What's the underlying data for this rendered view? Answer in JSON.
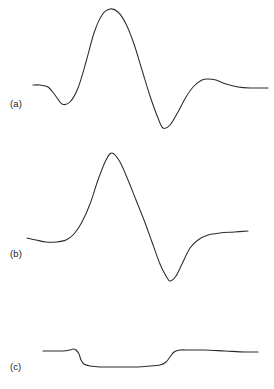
{
  "figure": {
    "background_color": "#ffffff",
    "trace_color": "#2b2b2b",
    "label_color": "#1b1b1b",
    "width": 274,
    "height": 389,
    "panel_labels": [
      {
        "id": "a",
        "text": "(a)"
      },
      {
        "id": "b",
        "text": "(b)"
      },
      {
        "id": "c",
        "text": "(c)"
      }
    ]
  },
  "chart_data": [
    {
      "type": "line",
      "panel": "(a)",
      "title": "",
      "subtitle": "",
      "xlabel": "",
      "ylabel": "",
      "grid": false,
      "axes_visible": false,
      "legend": "none",
      "annotations": [
        "(a)"
      ],
      "description": "Oscillatory wavelet-like trace: flat baseline, small negative dip, large positive peak, deep negative trough, small positive overshoot, return to baseline.",
      "xlim": [
        33,
        268
      ],
      "ylim": [
        8,
        129
      ],
      "baseline_y": 86,
      "features": [
        {
          "name": "left-baseline",
          "x": 33,
          "y": 85
        },
        {
          "name": "first-trough",
          "x": 62,
          "y": 104
        },
        {
          "name": "main-peak",
          "x": 110,
          "y": 9
        },
        {
          "name": "main-trough",
          "x": 163,
          "y": 128
        },
        {
          "name": "overshoot-bump",
          "x": 208,
          "y": 79
        },
        {
          "name": "right-baseline",
          "x": 268,
          "y": 88
        }
      ],
      "x": [
        33,
        40,
        48,
        55,
        62,
        70,
        78,
        86,
        94,
        102,
        110,
        118,
        126,
        134,
        142,
        150,
        158,
        163,
        170,
        178,
        186,
        194,
        202,
        208,
        216,
        226,
        238,
        250,
        268
      ],
      "y": [
        85,
        85,
        87,
        95,
        104,
        102,
        88,
        62,
        33,
        15,
        9,
        12,
        24,
        44,
        70,
        96,
        118,
        128,
        125,
        112,
        97,
        86,
        80,
        79,
        80,
        84,
        87,
        88,
        88
      ]
    },
    {
      "type": "line",
      "panel": "(b)",
      "title": "",
      "subtitle": "",
      "xlabel": "",
      "ylabel": "",
      "grid": false,
      "axes_visible": false,
      "legend": "none",
      "annotations": [
        "(b)"
      ],
      "description": "Single-cycle bipolar trace: flat low baseline, steep rise to a tall peak, steep fall to a deep trough, then asymptotic rise to an elevated plateau.",
      "xlim": [
        27,
        248
      ],
      "ylim": [
        153,
        281
      ],
      "baseline_y": 240,
      "features": [
        {
          "name": "left-baseline",
          "x": 27,
          "y": 238
        },
        {
          "name": "baseline-sag",
          "x": 58,
          "y": 242
        },
        {
          "name": "main-peak",
          "x": 112,
          "y": 153
        },
        {
          "name": "main-trough",
          "x": 170,
          "y": 281
        },
        {
          "name": "right-plateau",
          "x": 248,
          "y": 231
        }
      ],
      "x": [
        27,
        36,
        46,
        56,
        66,
        74,
        82,
        90,
        98,
        106,
        112,
        120,
        128,
        136,
        144,
        152,
        160,
        166,
        170,
        176,
        182,
        190,
        198,
        208,
        220,
        234,
        248
      ],
      "y": [
        238,
        240,
        242,
        242,
        240,
        234,
        222,
        204,
        180,
        160,
        153,
        162,
        180,
        200,
        220,
        242,
        264,
        276,
        281,
        276,
        264,
        248,
        240,
        235,
        233,
        232,
        231
      ]
    },
    {
      "type": "line",
      "panel": "(c)",
      "title": "",
      "subtitle": "",
      "xlabel": "",
      "ylabel": "",
      "grid": false,
      "axes_visible": false,
      "legend": "none",
      "annotations": [
        "(c)"
      ],
      "description": "Square-well / boxcar trace: flat upper baseline with a small upward blip, a sharp step down to a broad shallow well, then a sharp step back up to a slightly descending upper level.",
      "xlim": [
        43,
        258
      ],
      "ylim": [
        348,
        368
      ],
      "baseline_y": 351,
      "well_level_y": 367,
      "features": [
        {
          "name": "left-baseline",
          "x": 43,
          "y": 351
        },
        {
          "name": "pre-step-blip",
          "x": 73,
          "y": 349
        },
        {
          "name": "step-down",
          "x": 80,
          "y": 360
        },
        {
          "name": "well-floor",
          "x": 125,
          "y": 367
        },
        {
          "name": "step-up",
          "x": 170,
          "y": 357
        },
        {
          "name": "right-baseline",
          "x": 258,
          "y": 352
        }
      ],
      "x": [
        43,
        52,
        62,
        70,
        73,
        76,
        79,
        81,
        84,
        90,
        100,
        112,
        125,
        138,
        150,
        160,
        166,
        170,
        174,
        180,
        190,
        205,
        225,
        245,
        258
      ],
      "y": [
        351,
        351,
        351,
        350,
        349,
        350,
        354,
        360,
        364,
        366,
        367,
        367,
        367,
        367,
        366,
        365,
        362,
        357,
        352,
        350,
        350,
        350,
        351,
        352,
        352
      ]
    }
  ]
}
